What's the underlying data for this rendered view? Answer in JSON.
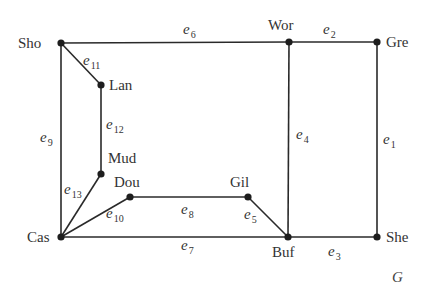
{
  "graph": {
    "name": "G",
    "vertices": [
      {
        "id": "Sho",
        "label": "Sho",
        "x": 61,
        "y": 43,
        "lx": 18,
        "ly": 48
      },
      {
        "id": "Wor",
        "label": "Wor",
        "x": 289,
        "y": 42,
        "lx": 268,
        "ly": 30
      },
      {
        "id": "Gre",
        "label": "Gre",
        "x": 377,
        "y": 42,
        "lx": 386,
        "ly": 47
      },
      {
        "id": "Lan",
        "label": "Lan",
        "x": 101,
        "y": 85,
        "lx": 109,
        "ly": 90
      },
      {
        "id": "Mud",
        "label": "Mud",
        "x": 101,
        "y": 174,
        "lx": 108,
        "ly": 163
      },
      {
        "id": "Dou",
        "label": "Dou",
        "x": 130,
        "y": 197,
        "lx": 114,
        "ly": 187
      },
      {
        "id": "Gil",
        "label": "Gil",
        "x": 248,
        "y": 197,
        "lx": 230,
        "ly": 187
      },
      {
        "id": "Cas",
        "label": "Cas",
        "x": 61,
        "y": 237,
        "lx": 27,
        "ly": 242
      },
      {
        "id": "Buf",
        "label": "Buf",
        "x": 288,
        "y": 237,
        "lx": 272,
        "ly": 257
      },
      {
        "id": "She",
        "label": "She",
        "x": 377,
        "y": 237,
        "lx": 386,
        "ly": 242
      }
    ],
    "edges": [
      {
        "id": "e1",
        "name": "e",
        "sub": "1",
        "from": "Gre",
        "to": "She",
        "lx": 383,
        "ly": 144
      },
      {
        "id": "e2",
        "name": "e",
        "sub": "2",
        "from": "Wor",
        "to": "Gre",
        "lx": 323,
        "ly": 34
      },
      {
        "id": "e3",
        "name": "e",
        "sub": "3",
        "from": "Buf",
        "to": "She",
        "lx": 328,
        "ly": 256
      },
      {
        "id": "e4",
        "name": "e",
        "sub": "4",
        "from": "Wor",
        "to": "Buf",
        "lx": 296,
        "ly": 139
      },
      {
        "id": "e5",
        "name": "e",
        "sub": "5",
        "from": "Gil",
        "to": "Buf",
        "lx": 244,
        "ly": 219
      },
      {
        "id": "e6",
        "name": "e",
        "sub": "6",
        "from": "Sho",
        "to": "Wor",
        "lx": 183,
        "ly": 34
      },
      {
        "id": "e7",
        "name": "e",
        "sub": "7",
        "from": "Cas",
        "to": "Buf",
        "lx": 181,
        "ly": 250
      },
      {
        "id": "e8",
        "name": "e",
        "sub": "8",
        "from": "Dou",
        "to": "Gil",
        "lx": 181,
        "ly": 214
      },
      {
        "id": "e9",
        "name": "e",
        "sub": "9",
        "from": "Sho",
        "to": "Cas",
        "lx": 40,
        "ly": 142
      },
      {
        "id": "e10",
        "name": "e",
        "sub": "10",
        "from": "Cas",
        "to": "Dou",
        "lx": 106,
        "ly": 218
      },
      {
        "id": "e11",
        "name": "e",
        "sub": "11",
        "from": "Sho",
        "to": "Lan",
        "lx": 83,
        "ly": 65
      },
      {
        "id": "e12",
        "name": "e",
        "sub": "12",
        "from": "Lan",
        "to": "Mud",
        "lx": 106,
        "ly": 129
      },
      {
        "id": "e13",
        "name": "e",
        "sub": "13",
        "from": "Cas",
        "to": "Mud",
        "lx": 64,
        "ly": 194
      }
    ],
    "graph_label": {
      "text": "G",
      "x": 392,
      "y": 282
    }
  }
}
